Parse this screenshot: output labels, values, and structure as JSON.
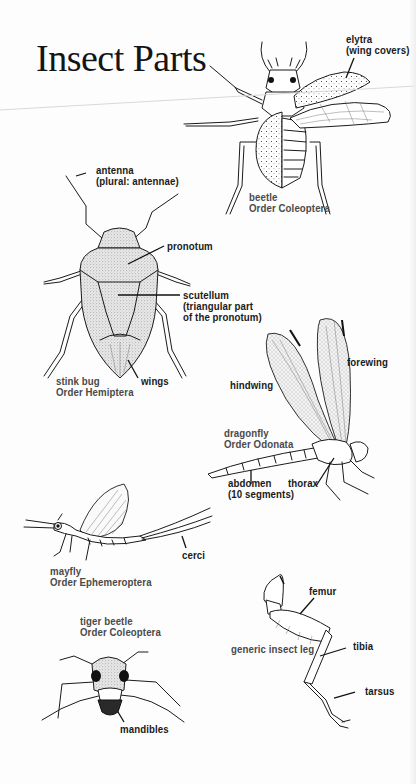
{
  "title": "Insect Parts",
  "colors": {
    "ink": "#1b1b1b",
    "caption": "#4a4a4a",
    "paper": "#fdfdfd"
  },
  "insects": {
    "beetle": {
      "name": "beetle",
      "order": "Order Coleoptera",
      "labels": {
        "elytra": "elytra",
        "elytra_note": "(wing covers)"
      }
    },
    "stink_bug": {
      "name": "stink bug",
      "order": "Order Hemiptera",
      "labels": {
        "antenna": "antenna",
        "antenna_note": "(plural: antennae)",
        "pronotum": "pronotum",
        "scutellum": "scutellum",
        "scutellum_note_1": "(triangular part",
        "scutellum_note_2": "of the pronotum)",
        "wings": "wings"
      }
    },
    "dragonfly": {
      "name": "dragonfly",
      "order": "Order Odonata",
      "labels": {
        "forewing": "forewing",
        "hindwing": "hindwing",
        "abdomen": "abdomen",
        "abdomen_note": "(10 segments)",
        "thorax": "thorax"
      }
    },
    "mayfly": {
      "name": "mayfly",
      "order": "Order Ephemeroptera",
      "labels": {
        "cerci": "cerci"
      }
    },
    "tiger_beetle": {
      "name": "tiger beetle",
      "order": "Order Coleoptera",
      "labels": {
        "mandibles": "mandibles"
      }
    },
    "leg": {
      "name": "generic insect leg",
      "labels": {
        "femur": "femur",
        "tibia": "tibia",
        "tarsus": "tarsus"
      }
    }
  }
}
